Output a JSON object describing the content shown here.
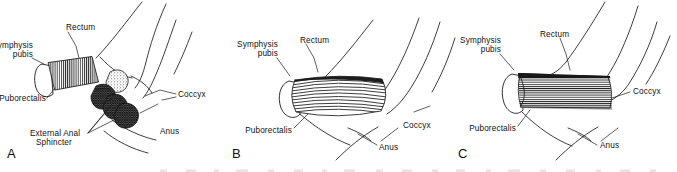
{
  "figure": {
    "background_color": "#ffffff",
    "ink_color": "#1a1a1a",
    "panel_count": 3,
    "style": "line-art anatomical illustration with hatched muscle striations"
  },
  "panels": [
    {
      "letter": "A",
      "description": "Puborectalis at rest with anorectal angle; external anal sphincter shown as stacked cross-hatched rings; stippled sling region",
      "labels": {
        "symphysis_pubis": "Symphysis\npubis",
        "symphysis_pubis_line1": "Symphysis",
        "symphysis_pubis_line2": "pubis",
        "rectum": "Rectum",
        "puborectalis": "Puborectalis",
        "external_anal_sphincter_line1": "External Anal",
        "external_anal_sphincter_line2": "Sphincter",
        "coccyx": "Coccyx",
        "anus": "Anus"
      }
    },
    {
      "letter": "B",
      "description": "Puborectalis contracted: short thick muscle belly with curved striations, acute anorectal angle",
      "labels": {
        "symphysis_pubis_line1": "Symphysis",
        "symphysis_pubis_line2": "pubis",
        "rectum": "Rectum",
        "puborectalis": "Puborectalis",
        "coccyx": "Coccyx",
        "anus": "Anus"
      }
    },
    {
      "letter": "C",
      "description": "Puborectalis relaxed/elongated: long cylindrical muscle with horizontal striations and dark superior border, straightened anorectal angle",
      "labels": {
        "symphysis_pubis_line1": "Symphysis",
        "symphysis_pubis_line2": "pubis",
        "rectum": "Rectum",
        "puborectalis": "Puborectalis",
        "coccyx": "Coccyx",
        "anus": "Anus"
      }
    }
  ],
  "caption": {
    "cut_off": true,
    "note": "A partial line of caption text is clipped at the bottom edge and is illegible"
  }
}
